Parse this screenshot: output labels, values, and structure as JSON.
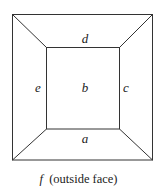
{
  "diagram": {
    "type": "planar-graph-faces",
    "faces": {
      "a": "a",
      "b": "b",
      "c": "c",
      "d": "d",
      "e": "e"
    },
    "caption": {
      "face": "f",
      "text": "(outside face)"
    },
    "stroke_color": "#333333"
  }
}
